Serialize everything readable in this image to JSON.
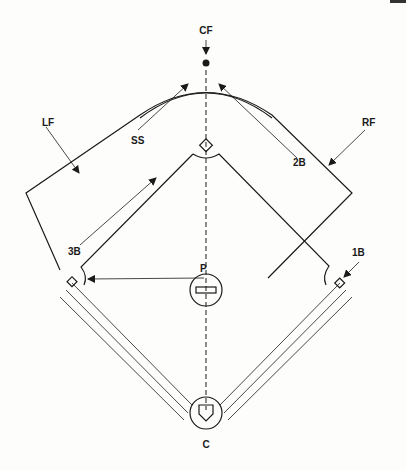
{
  "page_number_fragment": "",
  "positions": {
    "cf": "CF",
    "lf": "LF",
    "rf": "RF",
    "ss": "SS",
    "second_base": "2B",
    "third_base": "3B",
    "first_base": "1B",
    "pitcher": "P",
    "catcher": "C"
  },
  "colors": {
    "ink": "#1a1a1a",
    "paper": "#fdfdfb"
  }
}
